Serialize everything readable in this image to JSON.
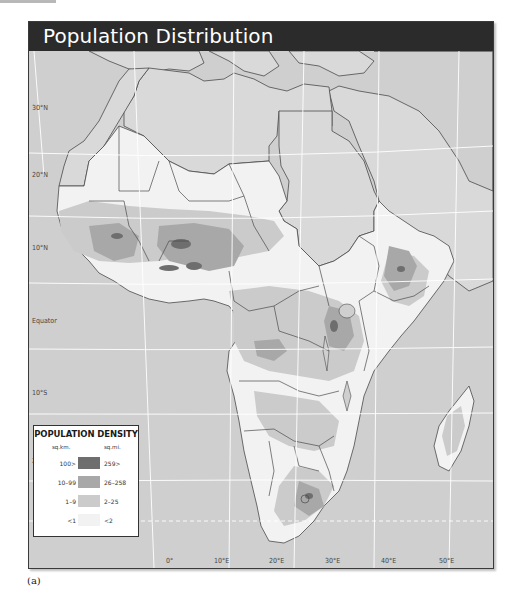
{
  "figure": {
    "title": "Population Distribution",
    "caption": "(a)"
  },
  "colors": {
    "title_bar": "#2b2b2b",
    "ocean": "#cfcfcf",
    "excluded_land": "#d9d9d9",
    "density_highest": "#6e6e6e",
    "density_high": "#a8a8a8",
    "density_medium": "#cbcbcb",
    "density_low": "#f2f2f2",
    "graticule": "#ffffff",
    "border": "#4a4a4a"
  },
  "map": {
    "latitudes": [
      {
        "label": "30°N"
      },
      {
        "label": "20°N"
      },
      {
        "label": "10°N"
      },
      {
        "label": "Equator"
      },
      {
        "label": "10°S"
      },
      {
        "label": "20°N"
      }
    ],
    "longitudes": [
      {
        "label": "0°"
      },
      {
        "label": "10°E"
      },
      {
        "label": "20°E"
      },
      {
        "label": "30°E"
      },
      {
        "label": "40°E"
      },
      {
        "label": "50°E"
      }
    ]
  },
  "legend": {
    "title": "POPULATION DENSITY",
    "unit_km": "sq.km.",
    "unit_mi": "sq.mi.",
    "items": [
      {
        "km": "100>",
        "mi": "259>",
        "color": "#6e6e6e"
      },
      {
        "km": "10–99",
        "mi": "26–258",
        "color": "#a8a8a8"
      },
      {
        "km": "1–9",
        "mi": "2–25",
        "color": "#cbcbcb"
      },
      {
        "km": "<1",
        "mi": "<2",
        "color": "#f2f2f2"
      }
    ]
  }
}
